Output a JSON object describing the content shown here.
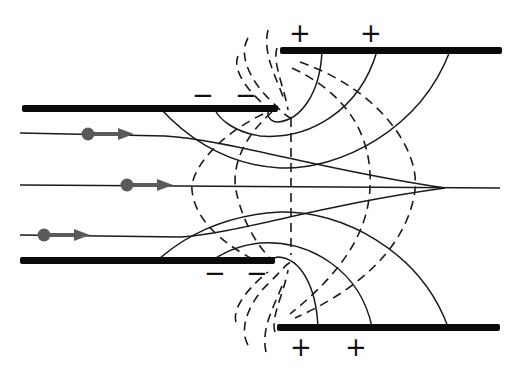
{
  "diagram": {
    "type": "electrostatic-lens",
    "colors": {
      "plate": "#0a0a0a",
      "field_line": "#1a1a1a",
      "equipotential": "#1a1a1a",
      "particle": "#5a5a5a",
      "background": "#ffffff"
    },
    "plates": [
      {
        "id": "left-upper",
        "x1": 22,
        "x2": 278,
        "y": 108,
        "charge": "negative"
      },
      {
        "id": "left-lower",
        "x1": 20,
        "x2": 275,
        "y": 260,
        "charge": "negative"
      },
      {
        "id": "right-upper",
        "x1": 280,
        "x2": 500,
        "y": 50,
        "charge": "positive"
      },
      {
        "id": "right-lower",
        "x1": 277,
        "x2": 500,
        "y": 327,
        "charge": "positive"
      }
    ],
    "labels": [
      {
        "text": "−",
        "x": 203,
        "y": 95
      },
      {
        "text": "−",
        "x": 246,
        "y": 95
      },
      {
        "text": "+",
        "x": 300,
        "y": 33
      },
      {
        "text": "+",
        "x": 371,
        "y": 33
      },
      {
        "text": "−",
        "x": 215,
        "y": 273
      },
      {
        "text": "−",
        "x": 257,
        "y": 273
      },
      {
        "text": "+",
        "x": 301,
        "y": 347
      },
      {
        "text": "+",
        "x": 356,
        "y": 347
      }
    ],
    "particles": [
      {
        "x": 88,
        "y": 134
      },
      {
        "x": 127,
        "y": 185
      },
      {
        "x": 44,
        "y": 235
      }
    ],
    "focal_point": {
      "x": 445,
      "y": 188
    }
  }
}
